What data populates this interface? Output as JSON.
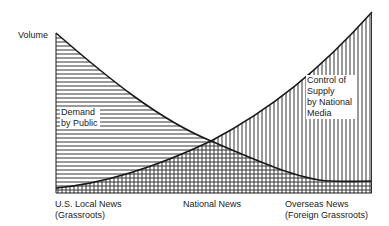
{
  "diagram": {
    "y_axis_label": "Volume",
    "x_axis_labels": [
      {
        "line1": "U.S. Local News",
        "line2": "(Grassroots)"
      },
      {
        "line1": "National News",
        "line2": ""
      },
      {
        "line1": "Overseas News",
        "line2": "(Foreign Grassroots)"
      }
    ],
    "series": [
      {
        "name": "demand",
        "label_lines": [
          "Demand",
          "by Public"
        ],
        "fill_pattern": "horizontal-hatch",
        "trend": "decreasing"
      },
      {
        "name": "supply",
        "label_lines": [
          "Control of",
          "Supply",
          "by National",
          "Media"
        ],
        "fill_pattern": "vertical-hatch",
        "trend": "increasing"
      }
    ],
    "overlap_pattern": "crosshatch",
    "colors": {
      "line": "#1a1a1a",
      "hatch": "#333333",
      "background": "#ffffff"
    }
  }
}
